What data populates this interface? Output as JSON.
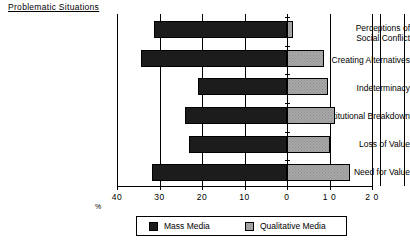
{
  "chart": {
    "category_axis_title": "Problematic  Situations",
    "xlabel": "%",
    "legend": {
      "mass_media": "Mass Media",
      "qualitative_media": "Qualitative Media"
    }
  },
  "chart_data": {
    "type": "bar",
    "orientation": "horizontal",
    "style": "diverging-bidirectional",
    "title": "",
    "xlabel": "%",
    "ylabel": "Problematic  Situations",
    "categories": [
      "Perceptions of\nSocial Conflict",
      "Creating Alternatives",
      "Indeterminacy",
      "Institutional Breakdown",
      "Loss of Value",
      "Need for Value"
    ],
    "series": [
      {
        "name": "Mass Media",
        "direction": "left",
        "color": "#1c1c1c",
        "values": [
          31.4,
          34.4,
          21.0,
          24.0,
          23.0,
          31.8
        ]
      },
      {
        "name": "Qualitative Media",
        "direction": "right",
        "color": "#a8a8a8",
        "values": [
          1.5,
          8.6,
          9.7,
          11.2,
          10.1,
          14.8
        ]
      }
    ],
    "xticks": [
      {
        "label": "40",
        "value": -40
      },
      {
        "label": "30",
        "value": -30
      },
      {
        "label": "20",
        "value": -20
      },
      {
        "label": "10",
        "value": -10
      },
      {
        "label": "0",
        "value": 0
      },
      {
        "label": "1 0",
        "value": 10
      },
      {
        "label": "2 0",
        "value": 20
      }
    ],
    "xlim": [
      -40,
      20
    ],
    "grid": true,
    "legend_position": "bottom"
  }
}
